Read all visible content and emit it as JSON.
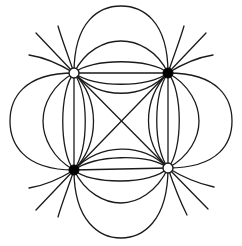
{
  "diagram": {
    "colors": {
      "line": "#1a1a1a",
      "background": "#ffffff",
      "positive_fill": "#ffffff",
      "negative_fill": "#000000"
    },
    "charges": [
      {
        "id": "top-left",
        "x": 74,
        "y": 73,
        "type": "open"
      },
      {
        "id": "top-right",
        "x": 168,
        "y": 73,
        "type": "filled"
      },
      {
        "id": "bottom-left",
        "x": 74,
        "y": 170,
        "type": "filled"
      },
      {
        "id": "bottom-right",
        "x": 168,
        "y": 168,
        "type": "open"
      }
    ]
  }
}
